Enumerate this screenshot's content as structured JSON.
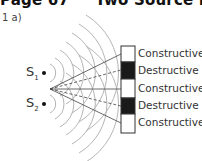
{
  "header": {
    "page": "Page 67",
    "title": "Two Source Interf"
  },
  "question_label": "1 a)",
  "sources": [
    {
      "label": "S",
      "subscript": "1"
    },
    {
      "label": "S",
      "subscript": "2"
    }
  ],
  "screen_bands": [
    {
      "label": "Constructive",
      "fill": "#ffffff"
    },
    {
      "label": "Destructive",
      "fill": "#1a1a1a"
    },
    {
      "label": "Constructive",
      "fill": "#ffffff"
    },
    {
      "label": "Destructive",
      "fill": "#1a1a1a"
    },
    {
      "label": "Constructive",
      "fill": "#ffffff"
    }
  ],
  "colors": {
    "wavefront": "#b5b5b5",
    "line": "#444444",
    "band_dark": "#1a1a1a"
  }
}
